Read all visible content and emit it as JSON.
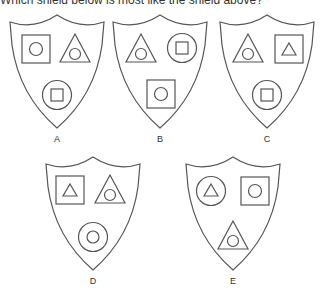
{
  "question": "Which shield below is most like the shield above?",
  "options": [
    {
      "label": "A",
      "top_left": "square-with-circle",
      "top_right": "triangle-with-circle",
      "bottom": "circle-with-square"
    },
    {
      "label": "B",
      "top_left": "triangle-with-circle",
      "top_right": "circle-with-square",
      "bottom": "square-with-circle"
    },
    {
      "label": "C",
      "top_left": "triangle-with-circle",
      "top_right": "square-with-triangle",
      "bottom": "circle-with-square"
    },
    {
      "label": "D",
      "top_left": "square-with-triangle",
      "top_right": "triangle-with-circle",
      "bottom": "circle-with-circle"
    },
    {
      "label": "E",
      "top_left": "circle-with-triangle",
      "top_right": "square-with-circle",
      "bottom": "triangle-with-circle"
    }
  ]
}
